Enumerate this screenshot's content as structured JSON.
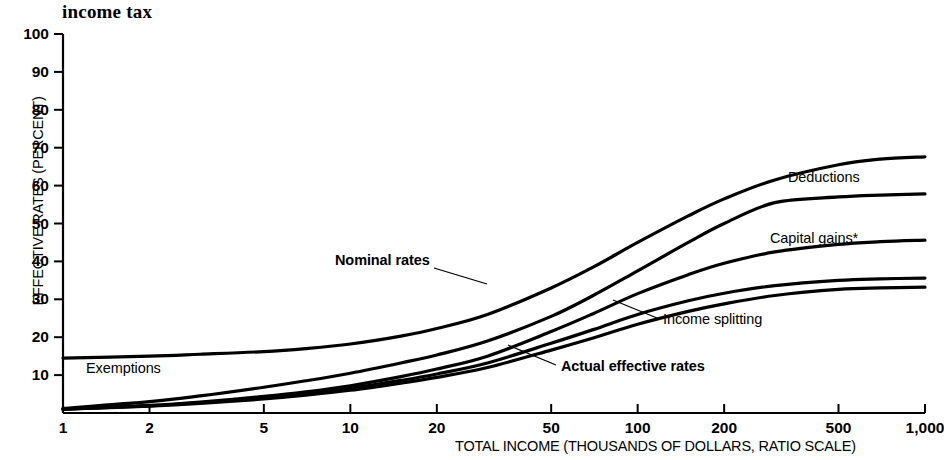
{
  "chart_data": {
    "type": "line",
    "title": "income tax",
    "xlabel": "TOTAL INCOME (THOUSANDS OF DOLLARS, RATIO SCALE)",
    "ylabel": "EFFECTIVE RATES (PERCENT)",
    "xscale": "log",
    "xlim": [
      1,
      1000
    ],
    "ylim": [
      0,
      100
    ],
    "grid": false,
    "legend_position": "inline-annotations",
    "xticks": [
      {
        "value": 1,
        "label": "1"
      },
      {
        "value": 2,
        "label": "2"
      },
      {
        "value": 5,
        "label": "5"
      },
      {
        "value": 10,
        "label": "10"
      },
      {
        "value": 20,
        "label": "20"
      },
      {
        "value": 50,
        "label": "50"
      },
      {
        "value": 100,
        "label": "100"
      },
      {
        "value": 200,
        "label": "200"
      },
      {
        "value": 500,
        "label": "500"
      },
      {
        "value": 1000,
        "label": "1,000"
      }
    ],
    "yticks": [
      {
        "value": 10,
        "label": "10"
      },
      {
        "value": 20,
        "label": "20"
      },
      {
        "value": 30,
        "label": "30"
      },
      {
        "value": 40,
        "label": "40"
      },
      {
        "value": 50,
        "label": "50"
      },
      {
        "value": 60,
        "label": "60"
      },
      {
        "value": 70,
        "label": "70"
      },
      {
        "value": 80,
        "label": "80"
      },
      {
        "value": 90,
        "label": "90"
      },
      {
        "value": 100,
        "label": "100"
      }
    ],
    "x": [
      1,
      2,
      3,
      5,
      7,
      10,
      15,
      20,
      30,
      50,
      70,
      100,
      150,
      200,
      300,
      500,
      700,
      1000
    ],
    "series": [
      {
        "name": "Nominal rates",
        "label": "Nominal rates",
        "label_bold": true,
        "values": [
          14.5,
          15.0,
          15.5,
          16.2,
          17.0,
          18.2,
          20.3,
          22.3,
          26.0,
          33.0,
          38.5,
          45.0,
          52.0,
          56.5,
          61.5,
          65.5,
          67.0,
          67.6
        ]
      },
      {
        "name": "Exemptions",
        "label": "Exemptions",
        "label_bold": false,
        "values": [
          1.2,
          3.0,
          4.5,
          6.8,
          8.5,
          10.5,
          13.2,
          15.3,
          19.0,
          25.5,
          31.0,
          37.5,
          45.0,
          50.0,
          55.5,
          57.0,
          57.5,
          57.8
        ]
      },
      {
        "name": "Deductions",
        "label": "Deductions",
        "label_bold": false,
        "values": [
          1.0,
          2.0,
          2.9,
          4.4,
          5.6,
          7.2,
          9.6,
          11.6,
          15.0,
          21.5,
          26.2,
          31.5,
          36.5,
          39.5,
          42.5,
          44.5,
          45.2,
          45.6
        ]
      },
      {
        "name": "Capital gains",
        "label": "Capital gains*",
        "label_bold": false,
        "values": [
          1.0,
          1.9,
          2.7,
          4.0,
          5.1,
          6.5,
          8.6,
          10.3,
          13.2,
          18.4,
          22.0,
          26.0,
          29.6,
          31.6,
          33.6,
          35.0,
          35.4,
          35.6
        ]
      },
      {
        "name": "Income splitting",
        "label": "Income splitting",
        "label_bold": false,
        "values": [
          1.0,
          1.8,
          2.5,
          3.7,
          4.7,
          6.0,
          7.9,
          9.4,
          12.0,
          16.6,
          19.8,
          23.4,
          26.8,
          28.8,
          31.0,
          32.6,
          33.0,
          33.2
        ]
      },
      {
        "name": "Actual effective rates",
        "label": "Actual effective rates",
        "label_bold": true,
        "values": [
          1.0,
          1.8,
          2.5,
          3.7,
          4.7,
          6.0,
          7.9,
          9.4,
          12.0,
          16.6,
          19.8,
          23.4,
          26.8,
          28.8,
          31.0,
          32.6,
          33.0,
          33.2
        ]
      }
    ],
    "annotations": [
      {
        "name": "nominal-rates",
        "text": "Nominal rates",
        "bold": true,
        "x": 335,
        "y": 252,
        "leader": [
          [
            434,
            268
          ],
          [
            487,
            284
          ]
        ]
      },
      {
        "name": "exemptions",
        "text": "Exemptions",
        "bold": false,
        "x": 86,
        "y": 360,
        "leader": null
      },
      {
        "name": "deductions",
        "text": "Deductions",
        "bold": false,
        "x": 788,
        "y": 169,
        "leader": null
      },
      {
        "name": "capital-gains",
        "text": "Capital gains*",
        "bold": false,
        "x": 770,
        "y": 230,
        "leader": null
      },
      {
        "name": "income-splitting",
        "text": "Income splitting",
        "bold": false,
        "x": 663,
        "y": 311,
        "leader": [
          [
            657,
            318
          ],
          [
            613,
            300
          ]
        ]
      },
      {
        "name": "actual-effective-rates",
        "text": "Actual effective rates",
        "bold": true,
        "x": 561,
        "y": 358,
        "leader": [
          [
            556,
            365
          ],
          [
            508,
            345
          ]
        ]
      }
    ]
  }
}
